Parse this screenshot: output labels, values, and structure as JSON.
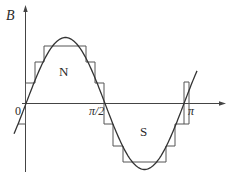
{
  "figure": {
    "axis_y_label": "B",
    "origin_label": "0",
    "tick_half_pi_label": "π/2",
    "tick_pi_label": "π",
    "north_label": "N",
    "south_label": "S",
    "curve": "sine wave of magnetic flux density B over one period",
    "stepped_approximation_levels": 3,
    "colors": {
      "stroke": "#333333",
      "background": "#ffffff"
    }
  }
}
